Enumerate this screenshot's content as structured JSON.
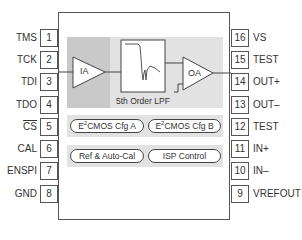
{
  "diagram": {
    "type": "ic-pinout-block-diagram",
    "left_pins": [
      {
        "number": "1",
        "label": "TMS"
      },
      {
        "number": "2",
        "label": "TCK"
      },
      {
        "number": "3",
        "label": "TDI"
      },
      {
        "number": "4",
        "label": "TDO"
      },
      {
        "number": "5",
        "label": "CS",
        "overbar": true
      },
      {
        "number": "6",
        "label": "CAL"
      },
      {
        "number": "7",
        "label": "ENSPI"
      },
      {
        "number": "8",
        "label": "GND"
      }
    ],
    "right_pins": [
      {
        "number": "16",
        "label": "VS"
      },
      {
        "number": "15",
        "label": "TEST"
      },
      {
        "number": "14",
        "label": "OUT+"
      },
      {
        "number": "13",
        "label": "OUT–"
      },
      {
        "number": "12",
        "label": "TEST"
      },
      {
        "number": "11",
        "label": "IN+"
      },
      {
        "number": "10",
        "label": "IN–"
      },
      {
        "number": "9",
        "label": "VREFOUT"
      }
    ],
    "blocks": {
      "ia": "IA",
      "lpf_label": "5th Order LPF",
      "oa": "OA",
      "cfg_a_prefix": "E",
      "cfg_a_sup": "2",
      "cfg_a_suffix": "CMOS Cfg A",
      "cfg_b_prefix": "E",
      "cfg_b_sup": "2",
      "cfg_b_suffix": "CMOS Cfg B",
      "ref": "Ref & Auto-Cal",
      "isp": "ISP Control"
    },
    "colors": {
      "outline": "#555555",
      "panel_light": "#e2e2e2",
      "panel_dark": "#c9c9c9",
      "text": "#333333"
    }
  }
}
